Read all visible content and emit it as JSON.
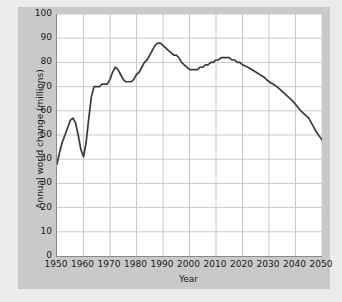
{
  "chart_data": {
    "type": "line",
    "title": "",
    "xlabel": "Year",
    "ylabel": "Annual world change (millions)",
    "xlim": [
      1950,
      2050
    ],
    "ylim": [
      0,
      100
    ],
    "grid": true,
    "legend_position": "none",
    "line_color": "#3a3a3a",
    "xticks": [
      1950,
      1960,
      1970,
      1980,
      1990,
      2000,
      2010,
      2020,
      2030,
      2040,
      2050
    ],
    "yticks": [
      0,
      10,
      20,
      30,
      40,
      50,
      60,
      70,
      80,
      90,
      100
    ],
    "series": [
      {
        "name": "Annual world population change",
        "x": [
          1950,
          1951,
          1952,
          1953,
          1954,
          1955,
          1956,
          1957,
          1958,
          1959,
          1960,
          1961,
          1962,
          1963,
          1964,
          1965,
          1966,
          1967,
          1968,
          1969,
          1970,
          1971,
          1972,
          1973,
          1974,
          1975,
          1976,
          1977,
          1978,
          1979,
          1980,
          1981,
          1982,
          1983,
          1984,
          1985,
          1986,
          1987,
          1988,
          1989,
          1990,
          1991,
          1992,
          1993,
          1994,
          1995,
          1996,
          1997,
          1998,
          1999,
          2000,
          2001,
          2002,
          2003,
          2004,
          2005,
          2006,
          2007,
          2008,
          2009,
          2010,
          2011,
          2012,
          2013,
          2014,
          2015,
          2016,
          2017,
          2018,
          2019,
          2020,
          2022,
          2025,
          2028,
          2030,
          2033,
          2036,
          2039,
          2042,
          2045,
          2048,
          2050
        ],
        "y": [
          38,
          43,
          47,
          50,
          53,
          56,
          57,
          55,
          50,
          44,
          41,
          47,
          57,
          66,
          70,
          70,
          70,
          71,
          71,
          71,
          73,
          76,
          78,
          77,
          75,
          73,
          72,
          72,
          72,
          73,
          75,
          76,
          78,
          80,
          81,
          83,
          85,
          87,
          88,
          88,
          87,
          86,
          85,
          84,
          83,
          83,
          82,
          80,
          79,
          78,
          77,
          77,
          77,
          77,
          78,
          78,
          79,
          79,
          80,
          80,
          81,
          81,
          82,
          82,
          82,
          82,
          81,
          81,
          80,
          80,
          79,
          78,
          76,
          74,
          72,
          70,
          67,
          64,
          60,
          57,
          51,
          48
        ]
      }
    ]
  },
  "axes": {
    "ytick_labels": [
      "100",
      "90",
      "80",
      "70",
      "60",
      "50",
      "40",
      "30",
      "20",
      "10",
      "0"
    ],
    "xtick_labels": [
      "1950",
      "1960",
      "1970",
      "1980",
      "1990",
      "2000",
      "2010",
      "2020",
      "2030",
      "2040",
      "2050"
    ],
    "xaxis_title": "Year",
    "yaxis_title": "Annual world change (millions)"
  },
  "colors": {
    "line": "#3a3a3a",
    "grid": "#c8c8c8",
    "axis": "#8a8a8a",
    "panel": "#c9c9c9",
    "background": "#ebebeb",
    "plot_background": "#ffffff"
  }
}
